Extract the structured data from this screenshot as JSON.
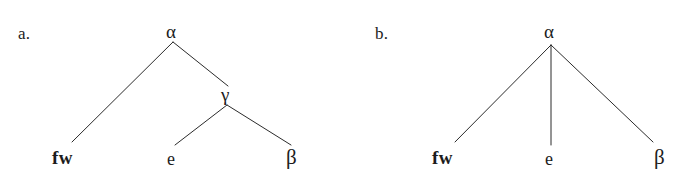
{
  "figure": {
    "type": "syntax-tree-diagram-pair",
    "background_color": "#ffffff",
    "ink_color": "#1c1c1c",
    "line_color": "#2b2b2b",
    "line_width_px": 1
  },
  "panels": [
    {
      "id": "a",
      "label": "a.",
      "label_pos": {
        "x": 18,
        "y": 25
      },
      "nodes": [
        {
          "id": "alpha-a",
          "label": "α",
          "role": "root",
          "style": "greek",
          "text_x": 166,
          "text_y": 22,
          "anchor_x": 173,
          "anchor_y": 42
        },
        {
          "id": "gamma-a",
          "label": "γ",
          "role": "internal",
          "style": "greek",
          "text_x": 221,
          "text_y": 85,
          "anchor_x": 227,
          "anchor_y": 105
        },
        {
          "id": "fw-a",
          "label": "fw",
          "role": "terminal",
          "style": "terminal-bold",
          "text_x": 52,
          "text_y": 148,
          "anchor_x": 72,
          "anchor_y": 142
        },
        {
          "id": "e-a",
          "label": "e",
          "role": "terminal",
          "style": "terminal-plain",
          "text_x": 167,
          "text_y": 150,
          "anchor_x": 175,
          "anchor_y": 145
        },
        {
          "id": "beta-a",
          "label": "β",
          "role": "terminal",
          "style": "greek-beta",
          "text_x": 286,
          "text_y": 147,
          "anchor_x": 290,
          "anchor_y": 145
        }
      ],
      "branches": [
        {
          "id": "alpha-a-to-fw-a",
          "from": "alpha-a",
          "to": "fw-a",
          "x1": 173,
          "y1": 42,
          "x2": 72,
          "y2": 142
        },
        {
          "id": "alpha-a-to-gamma-a",
          "from": "alpha-a",
          "to": "gamma-a",
          "x1": 173,
          "y1": 42,
          "x2": 228,
          "y2": 86
        },
        {
          "id": "gamma-a-to-e-a",
          "from": "gamma-a",
          "to": "e-a",
          "x1": 227,
          "y1": 105,
          "x2": 175,
          "y2": 145
        },
        {
          "id": "gamma-a-to-beta-a",
          "from": "gamma-a",
          "to": "beta-a",
          "x1": 227,
          "y1": 105,
          "x2": 291,
          "y2": 145
        }
      ]
    },
    {
      "id": "b",
      "label": "b.",
      "label_pos": {
        "x": 375,
        "y": 25
      },
      "nodes": [
        {
          "id": "alpha-b",
          "label": "α",
          "role": "root",
          "style": "greek",
          "text_x": 544,
          "text_y": 22,
          "anchor_x": 551,
          "anchor_y": 45
        },
        {
          "id": "fw-b",
          "label": "fw",
          "role": "terminal",
          "style": "terminal-bold",
          "text_x": 432,
          "text_y": 148,
          "anchor_x": 455,
          "anchor_y": 142
        },
        {
          "id": "e-b",
          "label": "e",
          "role": "terminal",
          "style": "terminal-plain",
          "text_x": 545,
          "text_y": 150,
          "anchor_x": 551,
          "anchor_y": 145
        },
        {
          "id": "beta-b",
          "label": "β",
          "role": "terminal",
          "style": "greek-beta",
          "text_x": 654,
          "text_y": 147,
          "anchor_x": 653,
          "anchor_y": 145
        }
      ],
      "branches": [
        {
          "id": "alpha-b-to-fw-b",
          "from": "alpha-b",
          "to": "fw-b",
          "x1": 551,
          "y1": 45,
          "x2": 455,
          "y2": 142
        },
        {
          "id": "alpha-b-to-e-b",
          "from": "alpha-b",
          "to": "e-b",
          "x1": 551,
          "y1": 45,
          "x2": 551,
          "y2": 145
        },
        {
          "id": "alpha-b-to-beta-b",
          "from": "alpha-b",
          "to": "beta-b",
          "x1": 551,
          "y1": 45,
          "x2": 653,
          "y2": 142
        }
      ]
    }
  ]
}
